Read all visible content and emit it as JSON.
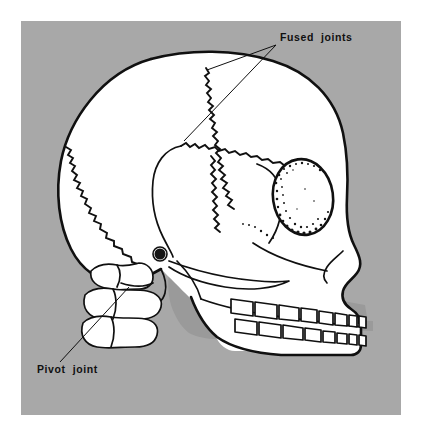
{
  "figure": {
    "kind": "anatomical-diagram",
    "panel": {
      "background_color": "#a8a8a8",
      "page_background_color": "#ffffff",
      "x": 21,
      "y": 21,
      "width": 380,
      "height": 394
    },
    "ink_color": "#101010",
    "bone_color": "#ffffff",
    "shadow_color": "#9a9a9a"
  },
  "labels": [
    {
      "id": "fused-joints",
      "text": "Fused  joints",
      "text_x": 259,
      "text_y": 20,
      "anchor": "start",
      "leaders": [
        {
          "from_x": 255,
          "from_y": 24,
          "to_x": 163,
          "to_y": 120
        },
        {
          "from_x": 255,
          "from_y": 24,
          "to_x": 186,
          "to_y": 49
        }
      ]
    },
    {
      "id": "pivot-joint",
      "text": "Pivot  joint",
      "text_x": 16,
      "text_y": 352,
      "anchor": "start",
      "leaders": [
        {
          "from_x": 39,
          "from_y": 341,
          "to_x": 108,
          "to_y": 266
        }
      ]
    }
  ],
  "anatomy": {
    "parts": [
      "cranium",
      "coronal-suture",
      "lambdoid-suture",
      "squamous-suture",
      "temporal-bone",
      "parietal-bone",
      "frontal-bone",
      "occipital-bone",
      "orbit",
      "zygomatic-arch",
      "ear-canal",
      "nasal-notch",
      "maxilla",
      "mandible",
      "upper-teeth",
      "lower-teeth",
      "cervical-vertebra-1",
      "cervical-vertebra-2",
      "cervical-vertebra-3"
    ],
    "tooth_counts": {
      "upper": 8,
      "lower": 8
    }
  }
}
